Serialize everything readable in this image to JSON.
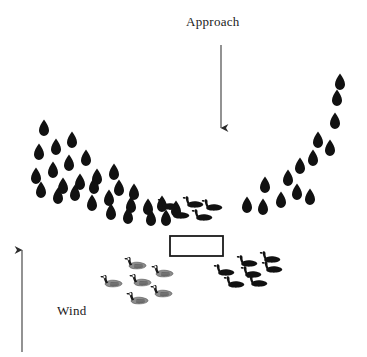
{
  "diagram": {
    "background_color": "#ffffff",
    "ink_color": "#111111",
    "width": 367,
    "height": 357,
    "labels": {
      "approach": "Approach",
      "wind": "Wind"
    },
    "arrows": [
      {
        "name": "approach-arrow",
        "direction": "down",
        "x1": 221,
        "y1": 45,
        "x2": 221,
        "y2": 128
      },
      {
        "name": "wind-arrow",
        "direction": "up",
        "x1": 22,
        "y1": 352,
        "x2": 22,
        "y2": 250
      }
    ],
    "blind": {
      "name": "hunting-blind",
      "x": 170,
      "y": 236,
      "width": 53,
      "height": 20,
      "stroke": "#1a1a1a",
      "fill": "#ffffff"
    },
    "teardrop_decoys": {
      "color": "#111111",
      "shape": "teardrop",
      "count": 42,
      "points": [
        [
          44,
          128
        ],
        [
          39,
          152
        ],
        [
          56,
          147
        ],
        [
          72,
          140
        ],
        [
          36,
          176
        ],
        [
          53,
          170
        ],
        [
          69,
          163
        ],
        [
          86,
          158
        ],
        [
          63,
          186
        ],
        [
          80,
          182
        ],
        [
          97,
          177
        ],
        [
          114,
          172
        ],
        [
          41,
          190
        ],
        [
          58,
          196
        ],
        [
          75,
          193
        ],
        [
          92,
          203
        ],
        [
          109,
          198
        ],
        [
          119,
          188
        ],
        [
          131,
          205
        ],
        [
          134,
          192
        ],
        [
          148,
          207
        ],
        [
          162,
          204
        ],
        [
          151,
          218
        ],
        [
          94,
          186
        ],
        [
          111,
          212
        ],
        [
          128,
          216
        ],
        [
          166,
          218
        ],
        [
          176,
          209
        ],
        [
          247,
          205
        ],
        [
          263,
          207
        ],
        [
          281,
          200
        ],
        [
          297,
          192
        ],
        [
          310,
          197
        ],
        [
          288,
          178
        ],
        [
          265,
          185
        ],
        [
          300,
          166
        ],
        [
          313,
          158
        ],
        [
          318,
          140
        ],
        [
          330,
          148
        ],
        [
          335,
          121
        ],
        [
          337,
          98
        ],
        [
          340,
          82
        ]
      ]
    },
    "black_goose_groups": [
      {
        "name": "upper-center-geese",
        "style": "solid-black",
        "count": 5,
        "points": [
          [
            166,
            205
          ],
          [
            191,
            203
          ],
          [
            177,
            214
          ],
          [
            200,
            216
          ],
          [
            210,
            206
          ]
        ]
      },
      {
        "name": "lower-right-geese",
        "style": "solid-black",
        "count": 6,
        "points": [
          [
            245,
            262
          ],
          [
            268,
            258
          ],
          [
            222,
            271
          ],
          [
            249,
            273
          ],
          [
            270,
            268
          ],
          [
            232,
            283
          ],
          [
            255,
            282
          ]
        ]
      }
    ],
    "canada_goose_group": {
      "name": "lower-left-canada-geese",
      "style": "detailed-canada-goose",
      "count": 6,
      "body_color": "#8c8c8c",
      "neck_color": "#1a1a1a",
      "cheek_color": "#ffffff",
      "points": [
        [
          133,
          264
        ],
        [
          109,
          282
        ],
        [
          138,
          281
        ],
        [
          160,
          272
        ],
        [
          159,
          292
        ],
        [
          135,
          299
        ]
      ]
    }
  }
}
